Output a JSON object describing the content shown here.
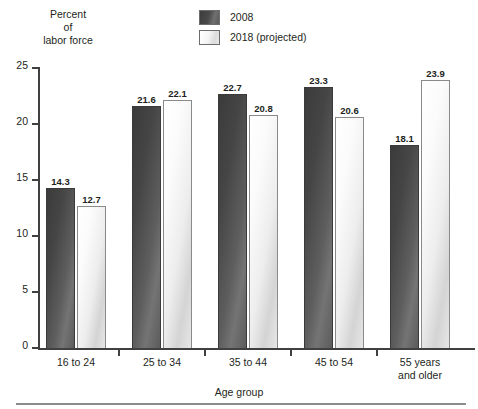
{
  "chart_data": {
    "type": "bar",
    "title": "",
    "xlabel": "Age group",
    "ylabel": "Percent\nof\nlabor force",
    "ylim": [
      0,
      25
    ],
    "yticks": [
      0,
      5,
      10,
      15,
      20,
      25
    ],
    "ytick_labels": [
      "0",
      "5",
      "10",
      "15",
      "20",
      "25"
    ],
    "grid": false,
    "legend_position": "top-center",
    "categories": [
      "16 to 24",
      "25 to 34",
      "35 to 44",
      "45 to 54",
      "55 years\nand older"
    ],
    "series": [
      {
        "name": "2008",
        "color": "#4a4a4a",
        "values": [
          14.3,
          21.6,
          22.7,
          23.3,
          18.1
        ],
        "value_labels": [
          "14.3",
          "21.6",
          "22.7",
          "23.3",
          "18.1"
        ]
      },
      {
        "name": "2018 (projected)",
        "color": "#e9e9e9",
        "values": [
          12.7,
          22.1,
          20.8,
          20.6,
          23.9
        ],
        "value_labels": [
          "12.7",
          "22.1",
          "20.8",
          "20.6",
          "23.9"
        ]
      }
    ]
  },
  "legend": {
    "items": [
      {
        "label": "2008",
        "swatch": "dark"
      },
      {
        "label": "2018 (projected)",
        "swatch": "light"
      }
    ]
  },
  "axes": {
    "y_title": "Percent\nof\nlabor force",
    "x_title": "Age group"
  }
}
